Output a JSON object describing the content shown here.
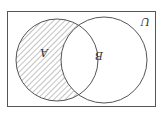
{
  "diagram": {
    "type": "venn",
    "orientation_rotation_deg": 180,
    "universe": {
      "label": "U"
    },
    "sets": [
      {
        "id": "A",
        "label": "A"
      },
      {
        "id": "B",
        "label": "B"
      }
    ],
    "shaded_region": "A \\ B",
    "colors": {
      "stroke": "#555555",
      "hatch": "#666666",
      "background": "#ffffff"
    }
  }
}
